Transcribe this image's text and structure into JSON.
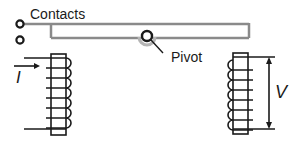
{
  "diagram": {
    "labels": {
      "contacts": "Contacts",
      "pivot": "Pivot",
      "current": "I",
      "voltage": "V"
    },
    "colors": {
      "ink": "#1a1a1a",
      "arm": "#8a8a8a",
      "pivot_shadow": "#b5b5b5"
    },
    "components": [
      {
        "name": "contact-top",
        "type": "terminal"
      },
      {
        "name": "contact-bottom",
        "type": "terminal"
      },
      {
        "name": "armature-bar",
        "type": "lever"
      },
      {
        "name": "pivot",
        "type": "hinge"
      },
      {
        "name": "input-coil",
        "type": "coil",
        "turns": 7
      },
      {
        "name": "output-coil",
        "type": "coil",
        "turns": 7
      }
    ]
  }
}
